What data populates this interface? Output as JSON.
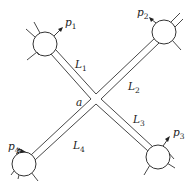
{
  "diagram": {
    "junction": {
      "label": "a",
      "x": 96,
      "y": 99
    },
    "nodes": [
      {
        "id": "node-1",
        "cx": 45,
        "cy": 44,
        "r": 12,
        "pressure_label": "p",
        "pressure_sub": "1"
      },
      {
        "id": "node-2",
        "cx": 164,
        "cy": 32,
        "r": 12,
        "pressure_label": "p",
        "pressure_sub": "2"
      },
      {
        "id": "node-3",
        "cx": 158,
        "cy": 157,
        "r": 12,
        "pressure_label": "p",
        "pressure_sub": "3"
      },
      {
        "id": "node-4",
        "cx": 24,
        "cy": 164,
        "r": 12,
        "pressure_label": "p",
        "pressure_sub": "4"
      }
    ],
    "pipes": [
      {
        "id": "pipe-1",
        "label": "L",
        "sub": "1"
      },
      {
        "id": "pipe-2",
        "label": "L",
        "sub": "2"
      },
      {
        "id": "pipe-3",
        "label": "L",
        "sub": "3"
      },
      {
        "id": "pipe-4",
        "label": "L",
        "sub": "4"
      }
    ],
    "colors": {
      "line": "#333333",
      "background": "#ffffff"
    }
  }
}
